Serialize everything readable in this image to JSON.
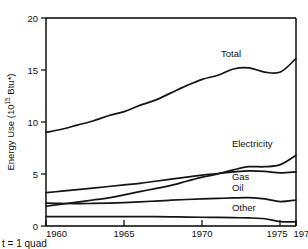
{
  "figure": {
    "name": "us-energy-use-by-source-line-chart",
    "footnote": "t = 1 quad"
  },
  "chart_data": {
    "type": "line",
    "title": "",
    "subtitle": "",
    "xlabel": "",
    "ylabel": "Energy Use (10",
    "ylabel_sup": "15",
    "ylabel_tail": " Btu*)",
    "xlim": [
      1960,
      1976
    ],
    "ylim": [
      0,
      20
    ],
    "grid": false,
    "legend": "inline-right-annotations",
    "xticks": [
      1960,
      1965,
      1970,
      1975,
      1976
    ],
    "xticklabels": [
      "1960",
      "1965",
      "1970",
      "1975",
      "1976"
    ],
    "yticks": [
      0,
      5,
      10,
      15,
      20
    ],
    "yticklabels": [
      "0",
      "5",
      "10",
      "15",
      "20"
    ],
    "x": [
      1960,
      1961,
      1962,
      1963,
      1964,
      1965,
      1966,
      1967,
      1968,
      1969,
      1970,
      1971,
      1972,
      1973,
      1974,
      1975,
      1976
    ],
    "series": [
      {
        "name": "Total",
        "label": "Total",
        "values": [
          9.0,
          9.3,
          9.7,
          10.1,
          10.6,
          11.0,
          11.6,
          12.1,
          12.8,
          13.5,
          14.1,
          14.5,
          15.1,
          15.2,
          14.8,
          14.8,
          16.1
        ]
      },
      {
        "name": "Electricity",
        "label": "Electricity",
        "values": [
          1.9,
          2.1,
          2.3,
          2.5,
          2.7,
          3.0,
          3.3,
          3.6,
          3.9,
          4.3,
          4.7,
          5.0,
          5.4,
          5.7,
          5.7,
          5.9,
          6.8
        ]
      },
      {
        "name": "Gas",
        "label": "Gas",
        "values": [
          3.2,
          3.35,
          3.5,
          3.65,
          3.8,
          3.95,
          4.1,
          4.3,
          4.5,
          4.7,
          4.9,
          5.05,
          5.2,
          5.3,
          5.25,
          5.1,
          5.2
        ]
      },
      {
        "name": "Oil",
        "label": "Oil",
        "values": [
          2.2,
          2.17,
          2.15,
          2.17,
          2.2,
          2.25,
          2.32,
          2.4,
          2.48,
          2.55,
          2.6,
          2.65,
          2.7,
          2.72,
          2.6,
          2.35,
          2.5
        ]
      },
      {
        "name": "Other",
        "label": "Other",
        "values": [
          0.9,
          0.9,
          0.9,
          0.9,
          0.9,
          0.9,
          0.9,
          0.9,
          0.88,
          0.86,
          0.84,
          0.82,
          0.8,
          0.78,
          0.7,
          0.42,
          0.4
        ]
      }
    ],
    "annotations": [
      {
        "text": "Total",
        "x": 1971.2,
        "y": 16.3
      },
      {
        "text": "Electricity",
        "x": 1971.9,
        "y": 7.6
      },
      {
        "text": "Gas",
        "x": 1971.9,
        "y": 4.45
      },
      {
        "text": "Oil",
        "x": 1971.9,
        "y": 3.35
      },
      {
        "text": "Other",
        "x": 1971.9,
        "y": 1.45
      }
    ]
  }
}
